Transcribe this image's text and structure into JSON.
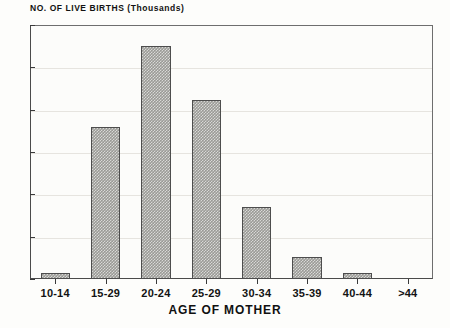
{
  "chart_data": {
    "type": "bar",
    "title": "",
    "ylabel": "NO. OF LIVE BIRTHS (Thousands)",
    "xlabel": "AGE OF MOTHER",
    "categories": [
      "10-14",
      "15-29",
      "20-24",
      "25-29",
      "30-34",
      "35-39",
      "40-44",
      ">44"
    ],
    "values": [
      0.7,
      18.0,
      27.5,
      21.2,
      8.5,
      2.6,
      0.7,
      0.05
    ],
    "ylim": [
      0,
      30
    ],
    "yticks": [
      0,
      5,
      10,
      15,
      20,
      25,
      30
    ],
    "ytick_labels": [
      "0",
      "5",
      "10",
      "15",
      "20",
      "25",
      "30"
    ],
    "grid": true,
    "grid_axis": "y",
    "legend": false,
    "bar_fill_color": "#9a9a96",
    "bar_edge_color": "#4d4d4d",
    "axis_color": "#4a4a4a",
    "grid_color": "#e6e4df",
    "background_color": "#fdfdfb"
  }
}
